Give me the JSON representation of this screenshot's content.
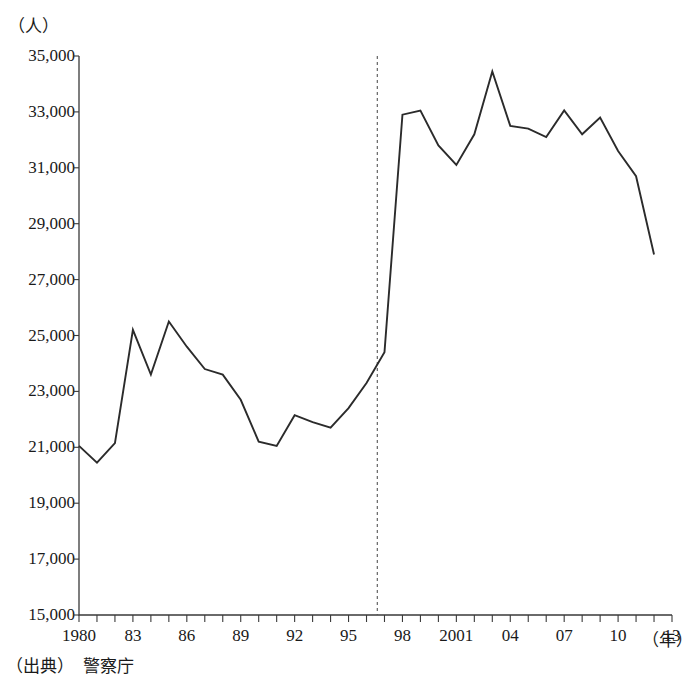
{
  "chart_data": {
    "type": "line",
    "title": "",
    "xlabel": "（年）",
    "ylabel": "（人）",
    "ylim": [
      15000,
      35000
    ],
    "xlim": [
      1980,
      2013
    ],
    "ytick_step": 2000,
    "grid": false,
    "legend": "none",
    "y_ticks": [
      "15,000",
      "17,000",
      "19,000",
      "21,000",
      "23,000",
      "25,000",
      "27,000",
      "29,000",
      "31,000",
      "33,000",
      "35,000"
    ],
    "y_tick_values": [
      15000,
      17000,
      19000,
      21000,
      23000,
      25000,
      27000,
      29000,
      31000,
      33000,
      35000
    ],
    "x_tick_labels": [
      {
        "value": 1980,
        "label": "1980"
      },
      {
        "value": 1983,
        "label": "83"
      },
      {
        "value": 1986,
        "label": "86"
      },
      {
        "value": 1989,
        "label": "89"
      },
      {
        "value": 1992,
        "label": "92"
      },
      {
        "value": 1995,
        "label": "95"
      },
      {
        "value": 1998,
        "label": "98"
      },
      {
        "value": 2001,
        "label": "2001"
      },
      {
        "value": 2004,
        "label": "04"
      },
      {
        "value": 2007,
        "label": "07"
      },
      {
        "value": 2010,
        "label": "10"
      },
      {
        "value": 2013,
        "label": "13"
      }
    ],
    "x": [
      1980,
      1981,
      1982,
      1983,
      1984,
      1985,
      1986,
      1987,
      1988,
      1989,
      1990,
      1991,
      1992,
      1993,
      1994,
      1995,
      1996,
      1997,
      1998,
      1999,
      2000,
      2001,
      2002,
      2003,
      2004,
      2005,
      2006,
      2007,
      2008,
      2009,
      2010,
      2011,
      2012
    ],
    "values": [
      21050,
      20450,
      21150,
      25200,
      23600,
      25500,
      24600,
      23800,
      23600,
      22700,
      21200,
      21050,
      22150,
      21900,
      21700,
      22400,
      23300,
      24400,
      32900,
      33050,
      31800,
      31100,
      32200,
      34450,
      32500,
      32400,
      32100,
      33050,
      32200,
      32800,
      31600,
      30700,
      27900
    ]
  },
  "annotations": {
    "vertical_marker_year": 1996.6,
    "vertical_marker_style": "dotted"
  },
  "source": {
    "label": "（出典）",
    "value": "警察庁",
    "full": "（出典）　警察庁"
  },
  "colors": {
    "line": "#2b2b2b",
    "axis": "#3a3a3a",
    "marker": "#555555",
    "background": "#ffffff",
    "text": "#1a1a1a"
  }
}
